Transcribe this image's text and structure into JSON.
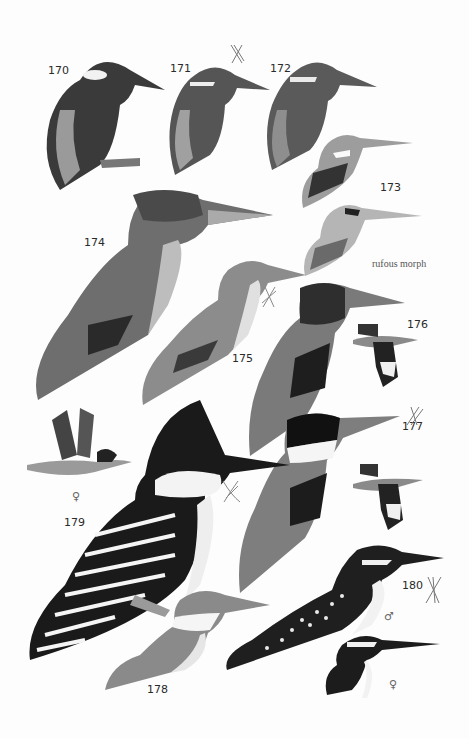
{
  "plate": {
    "background": "#fdfdfd",
    "species": [
      {
        "number": "170",
        "label_pos": [
          48,
          72
        ]
      },
      {
        "number": "171",
        "label_pos": [
          170,
          72
        ],
        "mark": "x-mark"
      },
      {
        "number": "172",
        "label_pos": [
          270,
          72
        ]
      },
      {
        "number": "173",
        "label_pos": [
          380,
          190
        ]
      },
      {
        "number": "174",
        "label_pos": [
          84,
          243
        ]
      },
      {
        "number": "175",
        "label_pos": [
          232,
          359
        ]
      },
      {
        "number": "176",
        "label_pos": [
          407,
          325
        ]
      },
      {
        "number": "177",
        "label_pos": [
          402,
          426
        ],
        "mark": "x-mark"
      },
      {
        "number": "178",
        "label_pos": [
          147,
          693
        ]
      },
      {
        "number": "179",
        "label_pos": [
          64,
          522
        ]
      },
      {
        "number": "180",
        "label_pos": [
          402,
          587
        ],
        "mark": "x-mark"
      }
    ],
    "captions": {
      "rufous_morph": "rufous morph"
    },
    "sex_symbols": {
      "female_179": "♀",
      "male_180": "♂",
      "female_180": "♀"
    }
  }
}
